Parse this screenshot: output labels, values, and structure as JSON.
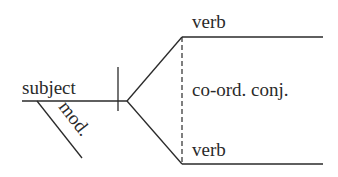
{
  "diagram": {
    "type": "sentence-diagram",
    "labels": {
      "subject": "subject",
      "modifier": "mod.",
      "verb_top": "verb",
      "conjunction": "co-ord. conj.",
      "verb_bottom": "verb"
    },
    "colors": {
      "line": "#2a2a2a",
      "text": "#2a2a2a",
      "background": "#ffffff"
    }
  }
}
